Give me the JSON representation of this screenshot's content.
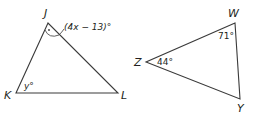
{
  "figure": {
    "triangle_jkl": {
      "vertices": {
        "J": {
          "label": "J",
          "x": 48,
          "y": 23
        },
        "K": {
          "label": "K",
          "x": 16,
          "y": 93
        },
        "L": {
          "label": "L",
          "x": 118,
          "y": 93
        }
      },
      "angles": {
        "J": {
          "label": "(4x − 13)°"
        },
        "K": {
          "label": "y°"
        }
      }
    },
    "triangle_wyz": {
      "vertices": {
        "W": {
          "label": "W",
          "x": 235,
          "y": 23
        },
        "Z": {
          "label": "Z",
          "x": 146,
          "y": 62
        },
        "Y": {
          "label": "Y",
          "x": 240,
          "y": 99
        }
      },
      "angles": {
        "W": {
          "label": "71°"
        },
        "Z": {
          "label": "44°"
        }
      }
    },
    "colors": {
      "stroke": "#3a3a3a",
      "text": "#231f20",
      "background": "#ffffff"
    }
  }
}
